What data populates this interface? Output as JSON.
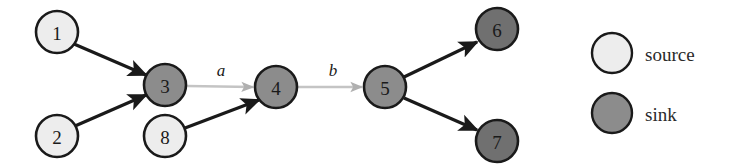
{
  "figure": {
    "type": "directed-graph",
    "width": 743,
    "height": 168,
    "background": "#ffffff"
  },
  "colors": {
    "source_fill": "#ededed",
    "sink_fill": "#8c8c8c",
    "sink_dark_fill": "#707070",
    "node_stroke": "#1a1a1a",
    "black_edge": "#1a1a1a",
    "gray_edge": "#b3b3b3",
    "text": "#1a1a1a"
  },
  "nodes": [
    {
      "id": "1",
      "label": "1",
      "kind": "source",
      "cx": 57,
      "cy": 32,
      "r": 21,
      "fill": "#ededed"
    },
    {
      "id": "2",
      "label": "2",
      "kind": "source",
      "cx": 57,
      "cy": 136,
      "r": 21,
      "fill": "#ededed"
    },
    {
      "id": "8",
      "label": "8",
      "kind": "source",
      "cx": 165,
      "cy": 136,
      "r": 21,
      "fill": "#ededed"
    },
    {
      "id": "3",
      "label": "3",
      "kind": "sink",
      "cx": 165,
      "cy": 85,
      "r": 21,
      "fill": "#8c8c8c"
    },
    {
      "id": "4",
      "label": "4",
      "kind": "sink",
      "cx": 276,
      "cy": 87,
      "r": 21,
      "fill": "#8c8c8c"
    },
    {
      "id": "5",
      "label": "5",
      "kind": "sink",
      "cx": 385,
      "cy": 87,
      "r": 21,
      "fill": "#8c8c8c"
    },
    {
      "id": "6",
      "label": "6",
      "kind": "sink",
      "cx": 497,
      "cy": 29,
      "r": 21,
      "fill": "#707070"
    },
    {
      "id": "7",
      "label": "7",
      "kind": "sink",
      "cx": 497,
      "cy": 141,
      "r": 21,
      "fill": "#707070"
    }
  ],
  "edges": [
    {
      "id": "e1",
      "from": "1",
      "to": "3",
      "style": "black",
      "label": ""
    },
    {
      "id": "e2",
      "from": "2",
      "to": "3",
      "style": "black",
      "label": ""
    },
    {
      "id": "e3",
      "from": "3",
      "to": "4",
      "style": "gray",
      "label": "a",
      "label_x": 221,
      "label_y": 70
    },
    {
      "id": "e4",
      "from": "8",
      "to": "4",
      "style": "black",
      "label": ""
    },
    {
      "id": "e5",
      "from": "4",
      "to": "5",
      "style": "gray",
      "label": "b",
      "label_x": 333,
      "label_y": 70
    },
    {
      "id": "e6",
      "from": "5",
      "to": "6",
      "style": "black",
      "label": ""
    },
    {
      "id": "e7",
      "from": "5",
      "to": "7",
      "style": "black",
      "label": ""
    }
  ],
  "legend": {
    "items": [
      {
        "id": "source",
        "label": "source",
        "fill": "#ededed",
        "cx": 612,
        "cy": 53,
        "r": 20,
        "text_x": 645,
        "text_y": 54
      },
      {
        "id": "sink",
        "label": "sink",
        "fill": "#8c8c8c",
        "cx": 612,
        "cy": 113,
        "r": 20,
        "text_x": 645,
        "text_y": 114
      }
    ]
  }
}
